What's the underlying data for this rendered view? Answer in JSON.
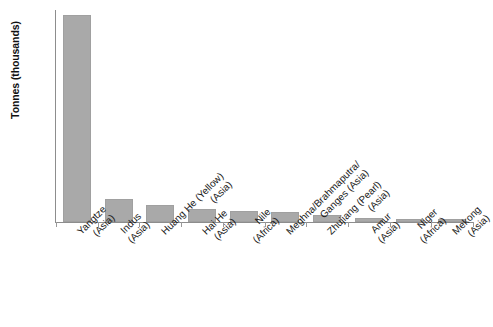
{
  "chart_data": {
    "type": "bar",
    "title": "",
    "subtitle": "",
    "xlabel": "",
    "ylabel": "Tonnes (thousands)",
    "ylim": [
      0,
      1500
    ],
    "ytick_step": 100,
    "yticks": [
      1500,
      1400,
      1300,
      1200,
      1100,
      1000,
      900,
      800,
      700,
      600,
      500,
      400,
      300,
      200,
      100,
      0
    ],
    "ytick_labels": [
      "1500",
      "1400",
      "1300",
      "1200",
      "1100",
      "1000",
      "900",
      "800",
      "700",
      "600",
      "500",
      "400",
      "300",
      "200",
      "100",
      "0"
    ],
    "grid": false,
    "legend": false,
    "legend_position": "none",
    "bar_color": "#a9a9a9",
    "axis_color": "#8d8d8d",
    "categories": [
      "Yangtze (Asia)",
      "Indus (Asia)",
      "Huang He (Yellow) (Asia)",
      "Hai He (Asia)",
      "Nile (Africa)",
      "Meghna/Brahmaputra/ Ganges (Asia)",
      "Zhujiang (Pearl) (Asia)",
      "Amur (Asia)",
      "Niger (Africa)",
      "Mekong (Asia)"
    ],
    "category_lines": [
      [
        "Yangtze",
        "(Asia)"
      ],
      [
        "Indus",
        "(Asia)"
      ],
      [
        "Huang He (Yellow)",
        "(Asia)"
      ],
      [
        "Hai He",
        "(Asia)"
      ],
      [
        "Nile",
        "(Africa)"
      ],
      [
        "Meghna/Brahmaputra/",
        "Ganges (Asia)"
      ],
      [
        "Zhujiang (Pearl)",
        "(Asia)"
      ],
      [
        "Amur",
        "(Asia)"
      ],
      [
        "Niger",
        "(Africa)"
      ],
      [
        "Mekong",
        "(Asia)"
      ]
    ],
    "values": [
      1465,
      163,
      118,
      90,
      78,
      68,
      48,
      30,
      24,
      22
    ]
  }
}
